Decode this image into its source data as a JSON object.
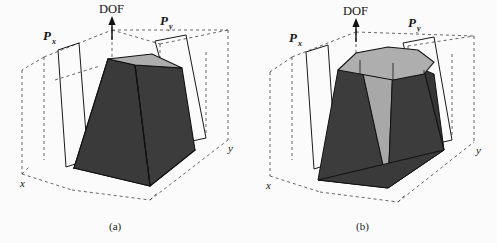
{
  "figure": {
    "caption_a": "(a)",
    "caption_b": "(b)",
    "background_color": "#fbfbfb"
  },
  "colors": {
    "face_dark": "#3c3c3c",
    "face_light": "#b2b2b2",
    "face_mid": "#9a9a9a",
    "edge": "#111111",
    "dashed": "#4a4a4a",
    "profile_outline": "#1a1a1a",
    "text": "#161616"
  },
  "panels": [
    {
      "id": "a",
      "caption": "(a)",
      "solid_name": "square-base-frustum",
      "labels": {
        "dof": "DOF",
        "profile_x": "P",
        "profile_x_sub": "x",
        "profile_y": "P",
        "profile_y_sub": "y",
        "axis_x": "x",
        "axis_y": "y"
      }
    },
    {
      "id": "b",
      "caption": "(b)",
      "solid_name": "octagonal-base-frustum",
      "labels": {
        "dof": "DOF",
        "profile_x": "P",
        "profile_x_sub": "x",
        "profile_y": "P",
        "profile_y_sub": "y",
        "axis_x": "x",
        "axis_y": "y"
      }
    }
  ]
}
